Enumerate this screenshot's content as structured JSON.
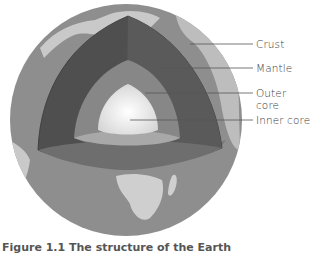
{
  "diagram": {
    "title": "Structure of the Earth",
    "labels": [
      {
        "text": "Crust",
        "y": 44
      },
      {
        "text": "Mantle",
        "y": 68
      },
      {
        "text": "Outer core",
        "y": 93
      },
      {
        "text": "Inner core",
        "y": 120
      }
    ],
    "caption": "Figure 1.1  The structure of the Earth",
    "colors": {
      "ocean": "#8e8e8e",
      "land": "#c9c9c9",
      "crust_face": "#bdbdbd",
      "mantle": "#4f4f4f",
      "outer_core": "#878787",
      "inner_core": "#e6e6e6",
      "label_line": "#555555"
    }
  }
}
